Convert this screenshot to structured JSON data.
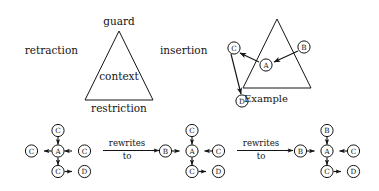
{
  "figure": {
    "background_color": "#ffffff",
    "ink_color": "#141414",
    "width": 379,
    "height": 191
  },
  "triangle_diagram": {
    "name": "guard-context-triangle",
    "apex_label": "guard",
    "left_side_label": "retraction",
    "right_side_label": "insertion",
    "base_label": "restriction",
    "interior_label": "context"
  },
  "example_diagram": {
    "name": "example-graph-over-triangle",
    "caption": "Example",
    "nodes": [
      {
        "id": "C",
        "label": "C",
        "x": 234,
        "y": 48
      },
      {
        "id": "B",
        "label": "B",
        "x": 304,
        "y": 47
      },
      {
        "id": "A",
        "label": "A",
        "x": 266,
        "y": 65
      },
      {
        "id": "D",
        "label": "D",
        "x": 242,
        "y": 101
      }
    ],
    "edges": [
      {
        "from": "A",
        "to": "C",
        "directed": true
      },
      {
        "from": "B",
        "to": "A",
        "directed": true
      },
      {
        "from": "C",
        "to": "D",
        "directed": true
      }
    ]
  },
  "rewrite_sequence": {
    "name": "rewrite-chain",
    "arrows": [
      {
        "id": "arrow-1",
        "line1": "rewrites",
        "line2": "to"
      },
      {
        "id": "arrow-2",
        "line1": "rewrites",
        "line2": "to"
      }
    ],
    "graphs": [
      {
        "id": "graph-1",
        "center": "A",
        "top": "C",
        "left": "C",
        "right": "C",
        "bottom": "C",
        "bottom_right": "D",
        "edges": [
          {
            "from": "C-top",
            "to": "A",
            "directed": true
          },
          {
            "from": "C-right",
            "to": "A",
            "directed": true
          },
          {
            "from": "A",
            "to": "C-left",
            "directed": true
          },
          {
            "from": "A",
            "to": "C-bottom",
            "directed": true
          },
          {
            "from": "C-bottom",
            "to": "D",
            "directed": true
          }
        ]
      },
      {
        "id": "graph-2",
        "center": "A",
        "top": "C",
        "left": "B",
        "right": "C",
        "bottom": "C",
        "bottom_right": "D",
        "edges": [
          {
            "from": "C-top",
            "to": "A",
            "directed": true
          },
          {
            "from": "B-left",
            "to": "A",
            "directed": true
          },
          {
            "from": "C-right",
            "to": "A",
            "directed": true
          },
          {
            "from": "A",
            "to": "C-bottom",
            "directed": true
          },
          {
            "from": "C-bottom",
            "to": "D",
            "directed": true
          }
        ]
      },
      {
        "id": "graph-3",
        "center": "A",
        "top": "B",
        "left": "B",
        "right": "C",
        "bottom": "C",
        "bottom_right": "D",
        "edges": [
          {
            "from": "B-top",
            "to": "A",
            "directed": true
          },
          {
            "from": "B-left",
            "to": "A",
            "directed": true
          },
          {
            "from": "C-right",
            "to": "A",
            "directed": true
          },
          {
            "from": "A",
            "to": "C-bottom",
            "directed": true
          },
          {
            "from": "C-bottom",
            "to": "D",
            "directed": true
          }
        ]
      }
    ]
  }
}
